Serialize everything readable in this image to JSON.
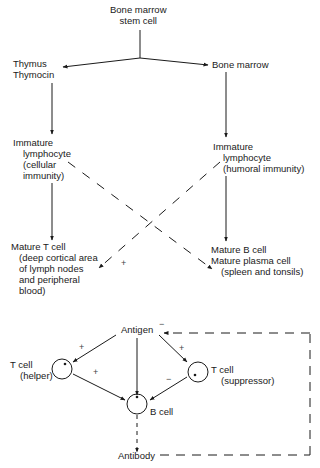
{
  "top_chart": {
    "root": {
      "line1": "Bone marrow",
      "line2": "stem cell"
    },
    "left_branch": {
      "origin": {
        "line1": "Thymus",
        "line2": "Thymocin"
      },
      "immature": {
        "line1": "Immature",
        "line2": "lymphocyte",
        "line3": "(cellular",
        "line4": "immunity)"
      },
      "mature": {
        "line1": "Mature T cell",
        "line2": "(deep cortical area",
        "line3": "of lymph nodes",
        "line4": "and peripheral",
        "line5": "blood)"
      }
    },
    "right_branch": {
      "origin": {
        "line1": "Bone marrow"
      },
      "immature": {
        "line1": "Immature",
        "line2": "lymphocyte",
        "line3": "(humoral immunity)"
      },
      "mature": {
        "line1": "Mature B cell",
        "line2": "Mature plasma cell",
        "line3": "(spleen and tonsils)"
      }
    },
    "cross_sign": "+"
  },
  "bottom_chart": {
    "antigen": "Antigen",
    "antigen_feedback_sign": "−",
    "t_helper": {
      "line1": "T cell",
      "line2": "(helper)"
    },
    "t_suppressor": {
      "line1": "T cell",
      "line2": "(suppressor)"
    },
    "b_cell": "B cell",
    "antibody": "Antibody",
    "signs": {
      "antigen_to_helper": "+",
      "helper_to_bcell": "+",
      "antigen_to_suppressor": "+",
      "suppressor_to_bcell": "−"
    }
  }
}
